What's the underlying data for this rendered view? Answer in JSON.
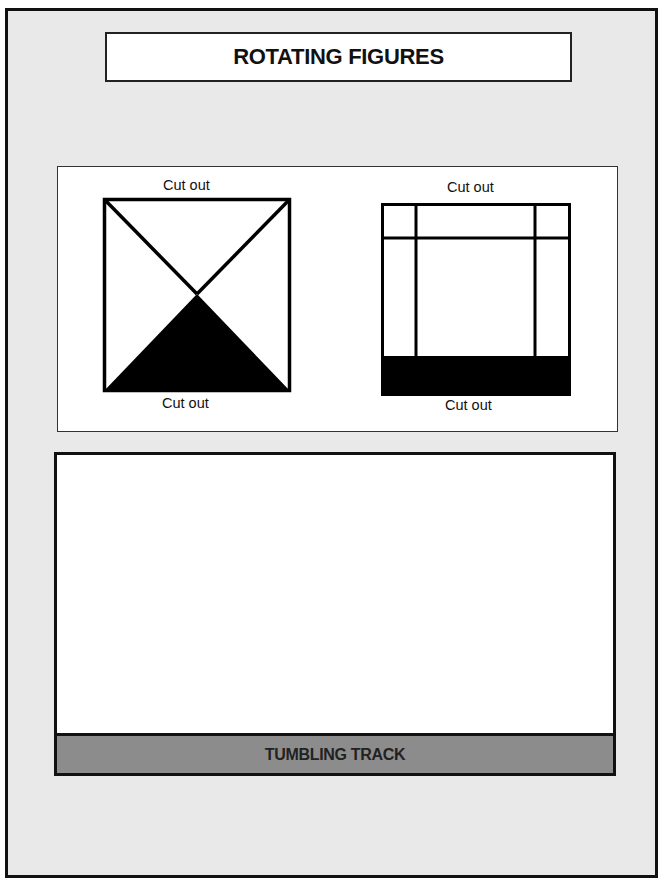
{
  "title": "ROTATING FIGURES",
  "figures": {
    "left_figure": {
      "shape": "square-with-diagonals",
      "top_label": "Cut out",
      "bottom_label": "Cut out",
      "shaded_region": "bottom-triangle"
    },
    "right_figure": {
      "shape": "square-with-grid-lines",
      "top_label": "Cut out",
      "bottom_label": "Cut out",
      "shaded_region": "bottom-band"
    }
  },
  "track": {
    "label": "TUMBLING TRACK"
  },
  "colors": {
    "page_background": "#e9e9e9",
    "panel_background": "#ffffff",
    "track_bar": "#8c8c8c",
    "ink": "#111111"
  }
}
